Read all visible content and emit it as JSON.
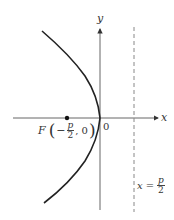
{
  "diagram": {
    "type": "parabola",
    "equation_orientation": "opens-left",
    "axes": {
      "x_label": "x",
      "y_label": "y",
      "origin_label": "0"
    },
    "focus": {
      "letter": "F",
      "open_paren": "(",
      "minus": "−",
      "frac_num": "p",
      "frac_den": "2",
      "comma_zero": ", 0",
      "close_paren": ")"
    },
    "directrix": {
      "lhs": "x",
      "eq": "=",
      "frac_num": "p",
      "frac_den": "2",
      "style": "dashed"
    },
    "colors": {
      "stroke": "#333333",
      "axis": "#555555",
      "dashed": "#888888",
      "background": "#ffffff"
    }
  }
}
